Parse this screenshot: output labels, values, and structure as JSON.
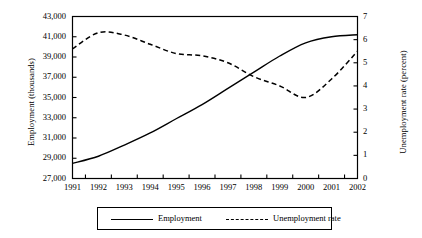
{
  "chart_data": {
    "type": "line",
    "title": "",
    "xlabel": "",
    "categories": [
      "1991",
      "1992",
      "1993",
      "1994",
      "1995",
      "1996",
      "1997",
      "1998",
      "1999",
      "2000",
      "2001",
      "2002"
    ],
    "x": [
      1991,
      1992,
      1993,
      1994,
      1995,
      1996,
      1997,
      1998,
      1999,
      2000,
      2001,
      2002
    ],
    "grid": false,
    "legend_position": "bottom",
    "axes": {
      "left": {
        "label": "Employment (thousands)",
        "ylim": [
          27000,
          43000
        ],
        "tick_step": 2000,
        "tick_labels": [
          "27,000",
          "29,000",
          "31,000",
          "33,000",
          "35,000",
          "37,000",
          "39,000",
          "41,000",
          "43,000"
        ],
        "tick_values": [
          27000,
          29000,
          31000,
          33000,
          35000,
          37000,
          39000,
          41000,
          43000
        ]
      },
      "right": {
        "label": "Unemployment rate (percent)",
        "ylim": [
          0,
          7
        ],
        "tick_step": 1,
        "tick_labels": [
          "0",
          "1",
          "2",
          "3",
          "4",
          "5",
          "6",
          "7"
        ],
        "tick_values": [
          0,
          1,
          2,
          3,
          4,
          5,
          6,
          7
        ]
      }
    },
    "series": [
      {
        "name": "Employment",
        "axis": "left",
        "style": "solid",
        "color": "#000000",
        "values": [
          28500,
          29200,
          30300,
          31500,
          32900,
          34300,
          35900,
          37500,
          39100,
          40400,
          41000,
          41200
        ]
      },
      {
        "name": "Unemployment rate",
        "axis": "right",
        "style": "dashed",
        "color": "#000000",
        "values": [
          5.6,
          6.3,
          6.2,
          5.8,
          5.4,
          5.3,
          5.0,
          4.4,
          4.0,
          3.5,
          4.3,
          5.5
        ]
      }
    ]
  },
  "legend": {
    "employment_label": "Employment",
    "unemployment_label": "Unemployment rate"
  }
}
